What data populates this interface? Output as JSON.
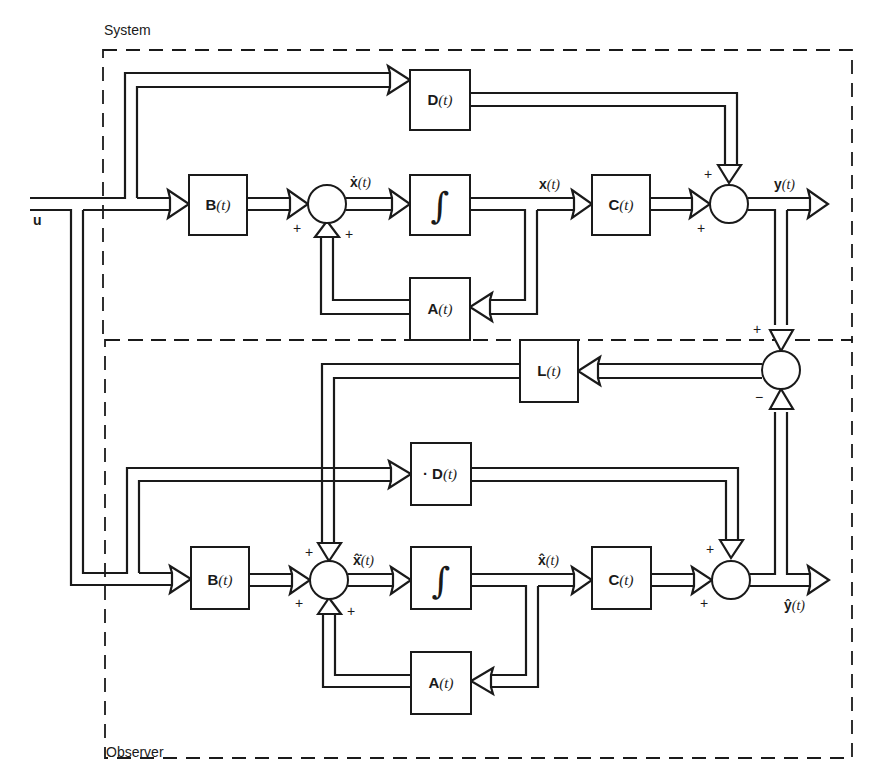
{
  "regions": {
    "system": {
      "label": "System"
    },
    "observer": {
      "label": "Observer"
    }
  },
  "input": {
    "label": "u"
  },
  "system": {
    "blocks": {
      "D": {
        "name": "D",
        "arg": "(t)"
      },
      "B": {
        "name": "B",
        "arg": "(t)"
      },
      "integrator": {
        "symbol": "∫"
      },
      "C": {
        "name": "C",
        "arg": "(t)"
      },
      "A": {
        "name": "A",
        "arg": "(t)"
      }
    },
    "signals": {
      "xdot": {
        "name": "ẋ",
        "arg": "(t)"
      },
      "x": {
        "name": "x",
        "arg": "(t)"
      },
      "y": {
        "name": "y",
        "arg": "(t)"
      }
    },
    "signs": {
      "sum1_left": "+",
      "sum1_bottom": "+",
      "sum2_top": "+",
      "sum2_left": "+"
    }
  },
  "observer": {
    "blocks": {
      "L": {
        "name": "L",
        "arg": "(t)"
      },
      "D": {
        "name": "· D",
        "arg": "(t)"
      },
      "B": {
        "name": "B",
        "arg": "(t)"
      },
      "integrator": {
        "symbol": "∫"
      },
      "C": {
        "name": "C",
        "arg": "(t)"
      },
      "A": {
        "name": "A",
        "arg": "(t)"
      }
    },
    "signals": {
      "xhatdot": {
        "name": "x̂̇",
        "arg": "(t)"
      },
      "xhat": {
        "name": "x̂",
        "arg": "(t)"
      },
      "yhat": {
        "name": "ŷ",
        "arg": "(t)"
      }
    },
    "signs": {
      "diff_top": "+",
      "diff_bottom": "−",
      "sum1_top": "+",
      "sum1_left": "+",
      "sum1_bottom": "+",
      "sum2_top": "+",
      "sum2_left": "+"
    }
  },
  "colors": {
    "ink": "#1a1a1a",
    "background": "#ffffff"
  }
}
